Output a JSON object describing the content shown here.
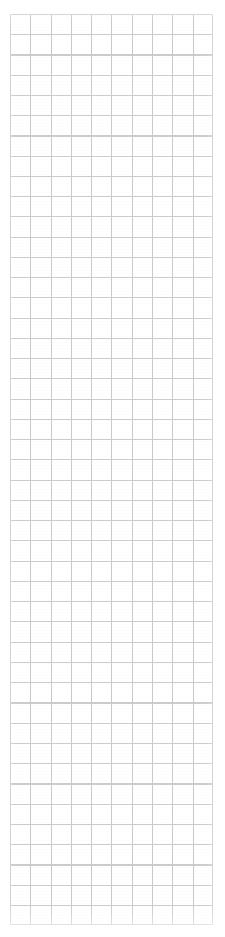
{
  "document": {
    "kind": "grid-paper-page",
    "title": "Blank grid paper page",
    "written_content": "",
    "page_background_color": "#ffffff"
  },
  "grid": {
    "label": "Ruled square grid",
    "columns": 10,
    "rows": 45,
    "cell_width_px": 20.3,
    "cell_height_px": 20.25,
    "left_px": 10,
    "top_px": 14,
    "width_px": 203,
    "height_px": 911,
    "vertical_line_color": "#c9c9c9",
    "horizontal_line_color": "#cccccc",
    "line_width_px": 1,
    "minor_subdivisions": 0
  },
  "margins": {
    "left_px": 10,
    "right_px": 12,
    "top_px": 14,
    "bottom_px": 12
  },
  "annotations": {
    "text_items": [],
    "note": ""
  }
}
